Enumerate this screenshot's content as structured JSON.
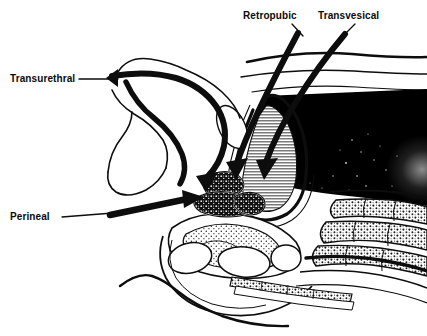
{
  "figure": {
    "kind": "anatomical-diagram",
    "width": 427,
    "height": 336,
    "background_color": "#ffffff",
    "ink_color": "#000000"
  },
  "labels": [
    {
      "id": "transurethral",
      "text": "Transurethral",
      "x": 10,
      "y": 82,
      "anchor": "start",
      "leader": {
        "x1": 79,
        "y1": 79,
        "x2": 118,
        "y2": 79
      }
    },
    {
      "id": "retropubic",
      "text": "Retropubic",
      "x": 243,
      "y": 19,
      "anchor": "start",
      "leader": {
        "x1": 292,
        "y1": 24,
        "x2": 303,
        "y2": 36
      }
    },
    {
      "id": "transvesical",
      "text": "Transvesical",
      "x": 318,
      "y": 19,
      "anchor": "start",
      "leader": {
        "x1": 355,
        "y1": 24,
        "x2": 342,
        "y2": 37
      }
    },
    {
      "id": "perineal",
      "text": "Perineal",
      "x": 10,
      "y": 220,
      "anchor": "start",
      "leader": {
        "x1": 62,
        "y1": 217,
        "x2": 113,
        "y2": 213
      }
    }
  ],
  "approaches": [
    {
      "id": "transurethral",
      "name": "Transurethral",
      "target": "prostate",
      "route": "via urethra"
    },
    {
      "id": "retropubic",
      "name": "Retropubic",
      "target": "prostate",
      "route": "behind pubic bone"
    },
    {
      "id": "transvesical",
      "name": "Transvesical",
      "target": "prostate",
      "route": "through bladder"
    },
    {
      "id": "perineal",
      "name": "Perineal",
      "target": "prostate",
      "route": "via perineum"
    }
  ],
  "structures": [
    {
      "id": "bladder",
      "name": "bladder",
      "fill": "hatch-horizontal",
      "fill_color": "#8f8f8f"
    },
    {
      "id": "prostate",
      "name": "prostate",
      "fill": "stipple",
      "fill_color": "#151515"
    },
    {
      "id": "rectum-soft-tissue",
      "name": "rectum and posterior soft tissue",
      "fill": "solid",
      "fill_color": "#000000"
    },
    {
      "id": "sacrum",
      "name": "sacrum and coccyx",
      "fill": "trabecular",
      "fill_color": "#222222"
    },
    {
      "id": "pubic-symphysis",
      "name": "pubic symphysis",
      "fill": "outline",
      "fill_color": "#ffffff"
    },
    {
      "id": "penis-urethra",
      "name": "penis and urethra",
      "fill": "outline",
      "fill_color": "#ffffff"
    },
    {
      "id": "abdominal-wall",
      "name": "abdominal wall",
      "fill": "outline",
      "fill_color": "#ffffff"
    }
  ]
}
